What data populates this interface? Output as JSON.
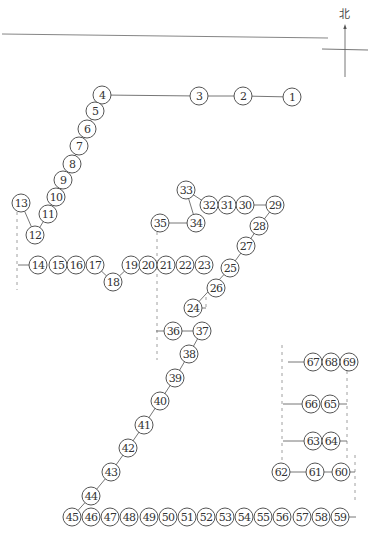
{
  "compass": {
    "label": "北",
    "x": 345,
    "y": 55
  },
  "top_rule": {
    "x1": 2,
    "y1": 34,
    "x2": 328,
    "y2": 38
  },
  "node_radius": 9,
  "nodes": [
    {
      "id": "1",
      "x": 292,
      "y": 97
    },
    {
      "id": "2",
      "x": 243,
      "y": 96
    },
    {
      "id": "3",
      "x": 199,
      "y": 96
    },
    {
      "id": "4",
      "x": 102,
      "y": 95
    },
    {
      "id": "5",
      "x": 95,
      "y": 111
    },
    {
      "id": "6",
      "x": 87,
      "y": 129
    },
    {
      "id": "7",
      "x": 79,
      "y": 146
    },
    {
      "id": "8",
      "x": 72,
      "y": 164
    },
    {
      "id": "9",
      "x": 63,
      "y": 180
    },
    {
      "id": "10",
      "x": 56,
      "y": 197
    },
    {
      "id": "11",
      "x": 48,
      "y": 214
    },
    {
      "id": "12",
      "x": 35,
      "y": 235
    },
    {
      "id": "13",
      "x": 21,
      "y": 203
    },
    {
      "id": "14",
      "x": 38,
      "y": 265
    },
    {
      "id": "15",
      "x": 58,
      "y": 265
    },
    {
      "id": "16",
      "x": 76,
      "y": 265
    },
    {
      "id": "17",
      "x": 95,
      "y": 265
    },
    {
      "id": "18",
      "x": 113,
      "y": 282
    },
    {
      "id": "19",
      "x": 131,
      "y": 265
    },
    {
      "id": "20",
      "x": 148,
      "y": 265
    },
    {
      "id": "21",
      "x": 166,
      "y": 265
    },
    {
      "id": "22",
      "x": 185,
      "y": 265
    },
    {
      "id": "23",
      "x": 204,
      "y": 265
    },
    {
      "id": "24",
      "x": 193,
      "y": 308
    },
    {
      "id": "25",
      "x": 230,
      "y": 268
    },
    {
      "id": "26",
      "x": 216,
      "y": 288
    },
    {
      "id": "27",
      "x": 246,
      "y": 246
    },
    {
      "id": "28",
      "x": 259,
      "y": 226
    },
    {
      "id": "29",
      "x": 275,
      "y": 205
    },
    {
      "id": "30",
      "x": 245,
      "y": 205
    },
    {
      "id": "31",
      "x": 227,
      "y": 205
    },
    {
      "id": "32",
      "x": 209,
      "y": 205
    },
    {
      "id": "33",
      "x": 186,
      "y": 190
    },
    {
      "id": "34",
      "x": 196,
      "y": 223
    },
    {
      "id": "35",
      "x": 160,
      "y": 223
    },
    {
      "id": "36",
      "x": 173,
      "y": 331
    },
    {
      "id": "37",
      "x": 202,
      "y": 331
    },
    {
      "id": "38",
      "x": 189,
      "y": 354
    },
    {
      "id": "39",
      "x": 175,
      "y": 378
    },
    {
      "id": "40",
      "x": 160,
      "y": 401
    },
    {
      "id": "41",
      "x": 144,
      "y": 425
    },
    {
      "id": "42",
      "x": 128,
      "y": 448
    },
    {
      "id": "43",
      "x": 111,
      "y": 472
    },
    {
      "id": "44",
      "x": 91,
      "y": 496
    },
    {
      "id": "45",
      "x": 72,
      "y": 517
    },
    {
      "id": "46",
      "x": 91,
      "y": 517
    },
    {
      "id": "47",
      "x": 110,
      "y": 517
    },
    {
      "id": "48",
      "x": 129,
      "y": 517
    },
    {
      "id": "49",
      "x": 149,
      "y": 517
    },
    {
      "id": "50",
      "x": 168,
      "y": 517
    },
    {
      "id": "51",
      "x": 187,
      "y": 517
    },
    {
      "id": "52",
      "x": 206,
      "y": 517
    },
    {
      "id": "53",
      "x": 225,
      "y": 517
    },
    {
      "id": "54",
      "x": 244,
      "y": 517
    },
    {
      "id": "55",
      "x": 263,
      "y": 517
    },
    {
      "id": "56",
      "x": 282,
      "y": 517
    },
    {
      "id": "57",
      "x": 302,
      "y": 517
    },
    {
      "id": "58",
      "x": 321,
      "y": 517
    },
    {
      "id": "59",
      "x": 340,
      "y": 517
    },
    {
      "id": "60",
      "x": 341,
      "y": 472
    },
    {
      "id": "61",
      "x": 315,
      "y": 472
    },
    {
      "id": "62",
      "x": 281,
      "y": 472
    },
    {
      "id": "63",
      "x": 313,
      "y": 441
    },
    {
      "id": "64",
      "x": 331,
      "y": 441
    },
    {
      "id": "65",
      "x": 330,
      "y": 404
    },
    {
      "id": "66",
      "x": 311,
      "y": 404
    },
    {
      "id": "67",
      "x": 313,
      "y": 362
    },
    {
      "id": "68",
      "x": 331,
      "y": 362
    },
    {
      "id": "69",
      "x": 349,
      "y": 362
    }
  ],
  "edges": [
    [
      "1",
      "2"
    ],
    [
      "2",
      "3"
    ],
    [
      "3",
      "4"
    ],
    [
      "4",
      "5"
    ],
    [
      "5",
      "6"
    ],
    [
      "6",
      "7"
    ],
    [
      "7",
      "8"
    ],
    [
      "8",
      "9"
    ],
    [
      "9",
      "10"
    ],
    [
      "10",
      "11"
    ],
    [
      "11",
      "12"
    ],
    [
      "12",
      "13"
    ],
    [
      "17",
      "18"
    ],
    [
      "18",
      "19"
    ],
    [
      "24",
      "25"
    ],
    [
      "25",
      "27"
    ],
    [
      "27",
      "28"
    ],
    [
      "28",
      "29"
    ],
    [
      "29",
      "30"
    ],
    [
      "32",
      "33"
    ],
    [
      "33",
      "34"
    ],
    [
      "34",
      "35"
    ],
    [
      "36",
      "37"
    ],
    [
      "37",
      "38"
    ],
    [
      "38",
      "39"
    ],
    [
      "39",
      "40"
    ],
    [
      "40",
      "41"
    ],
    [
      "41",
      "42"
    ],
    [
      "42",
      "43"
    ],
    [
      "43",
      "44"
    ],
    [
      "44",
      "45"
    ],
    [
      "62",
      "61"
    ],
    [
      "61",
      "60"
    ]
  ],
  "stubs": [
    {
      "x1": 18,
      "y1": 265,
      "x2": 29,
      "y2": 265
    },
    {
      "x1": 156,
      "y1": 331,
      "x2": 164,
      "y2": 331
    },
    {
      "x1": 202,
      "y1": 308,
      "x2": 206,
      "y2": 308
    },
    {
      "x1": 288,
      "y1": 362,
      "x2": 304,
      "y2": 362
    },
    {
      "x1": 283,
      "y1": 404,
      "x2": 302,
      "y2": 404
    },
    {
      "x1": 283,
      "y1": 441,
      "x2": 304,
      "y2": 441
    },
    {
      "x1": 339,
      "y1": 404,
      "x2": 347,
      "y2": 404
    },
    {
      "x1": 340,
      "y1": 441,
      "x2": 347,
      "y2": 441
    },
    {
      "x1": 349,
      "y1": 517,
      "x2": 356,
      "y2": 517
    },
    {
      "x1": 350,
      "y1": 472,
      "x2": 355,
      "y2": 472
    }
  ],
  "dashed_lines": [
    {
      "x1": 17,
      "y1": 212,
      "x2": 17,
      "y2": 290
    },
    {
      "x1": 157,
      "y1": 232,
      "x2": 157,
      "y2": 360
    },
    {
      "x1": 206,
      "y1": 297,
      "x2": 206,
      "y2": 310
    },
    {
      "x1": 282,
      "y1": 345,
      "x2": 282,
      "y2": 462
    },
    {
      "x1": 347,
      "y1": 371,
      "x2": 347,
      "y2": 460
    },
    {
      "x1": 355,
      "y1": 455,
      "x2": 355,
      "y2": 500
    }
  ]
}
